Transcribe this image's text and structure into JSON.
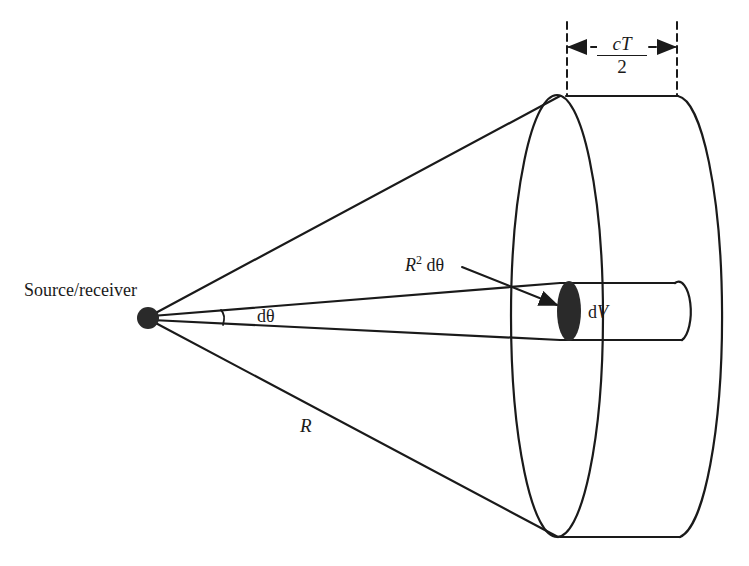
{
  "diagram": {
    "labels": {
      "source": "Source/receiver",
      "angle": "dθ",
      "area_base": "R",
      "area_sup": "2",
      "area_rest": " dθ",
      "volume_d": "d",
      "volume_v": "V",
      "range": "R",
      "pulse_num": "cT",
      "pulse_den": "2"
    },
    "colors": {
      "line": "#1a1a1a",
      "background": "#ffffff",
      "fill": "#2a2a2a"
    }
  }
}
